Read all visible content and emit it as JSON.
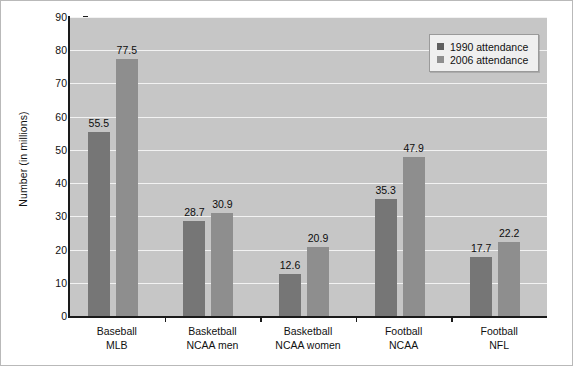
{
  "chart_data": {
    "type": "bar",
    "title": "",
    "xlabel": "",
    "ylabel": "Number (in millions)",
    "ylim": [
      0,
      90
    ],
    "yticks": [
      0,
      10,
      20,
      30,
      40,
      50,
      60,
      70,
      80,
      90
    ],
    "grid": true,
    "legend_position": "top-right",
    "categories": [
      "Baseball\nMLB",
      "Basketball\nNCAA men",
      "Basketball\nNCAA women",
      "Football\nNCAA",
      "Football\nNFL"
    ],
    "category_lines": [
      [
        "Baseball",
        "MLB"
      ],
      [
        "Basketball",
        "NCAA men"
      ],
      [
        "Basketball",
        "NCAA women"
      ],
      [
        "Football",
        "NCAA"
      ],
      [
        "Football",
        "NFL"
      ]
    ],
    "series": [
      {
        "name": "1990 attendance",
        "color": "#767676",
        "values": [
          55.5,
          28.7,
          12.6,
          35.3,
          17.7
        ],
        "labels": [
          "55.5",
          "28.7",
          "12.6",
          "35.3",
          "17.7"
        ]
      },
      {
        "name": "2006 attendance",
        "color": "#8e8e8e",
        "values": [
          77.5,
          30.9,
          20.9,
          47.9,
          22.2
        ],
        "labels": [
          "77.5",
          "30.9",
          "20.9",
          "47.9",
          "22.2"
        ]
      }
    ]
  },
  "legend": {
    "entries": [
      {
        "label": "1990 attendance"
      },
      {
        "label": "2006 attendance"
      }
    ]
  },
  "colors": {
    "plot_background": "#c6c6c6",
    "gridline": "#f2f2f2",
    "axis": "#1a1a1a",
    "series_1990": "#767676",
    "series_2006": "#8e8e8e"
  }
}
